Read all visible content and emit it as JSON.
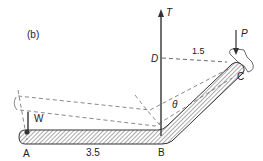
{
  "figure": {
    "panel_label": "(b)",
    "points": {
      "A": "A",
      "B": "B",
      "C": "C",
      "D": "D"
    },
    "forces": {
      "tension": "T",
      "load": "P",
      "weight": "W"
    },
    "dimensions": {
      "AB": "3.5",
      "DC": "1.5"
    },
    "angle": "θ"
  }
}
